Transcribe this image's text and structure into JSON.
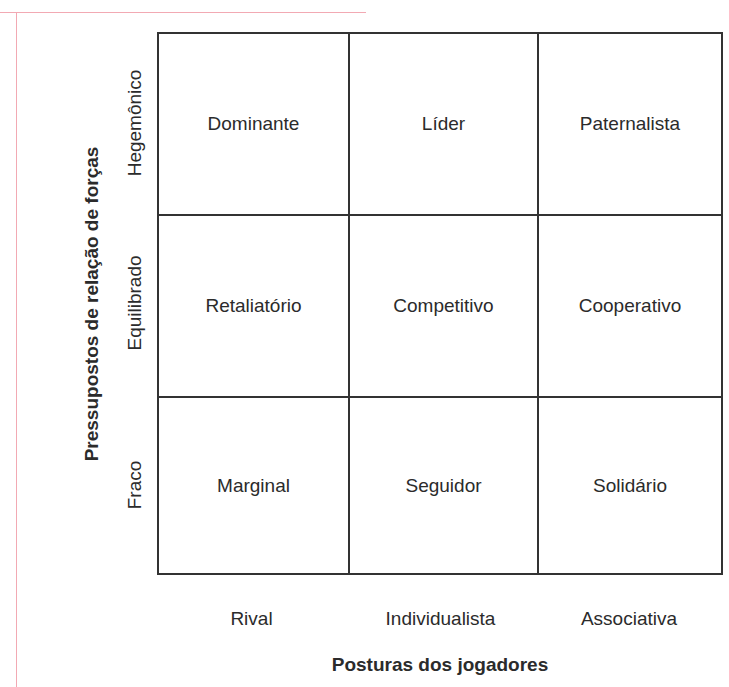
{
  "colors": {
    "rule": "#f2a9b3",
    "line": "#333333",
    "text": "#2b2b2b"
  },
  "y_axis": {
    "title": "Pressupostos de relação de forças",
    "rows": [
      "Hegemônico",
      "Equilibrado",
      "Fraco"
    ]
  },
  "x_axis": {
    "title": "Posturas dos jogadores",
    "columns": [
      "Rival",
      "Individualista",
      "Associativa"
    ]
  },
  "matrix": [
    [
      "Dominante",
      "Líder",
      "Paternalista"
    ],
    [
      "Retaliatório",
      "Competitivo",
      "Cooperativo"
    ],
    [
      "Marginal",
      "Seguidor",
      "Solidário"
    ]
  ]
}
